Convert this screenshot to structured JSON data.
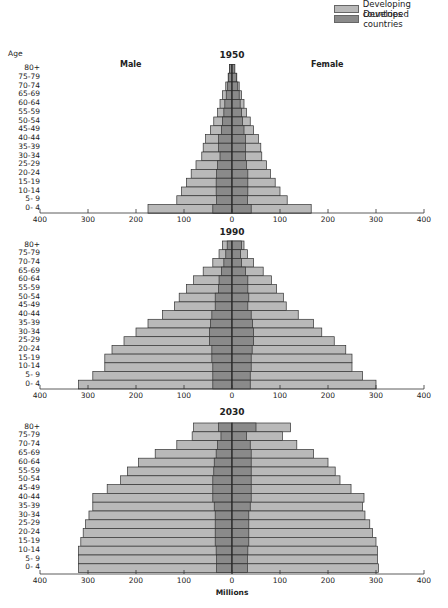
{
  "legend": {
    "items": [
      {
        "label": "Developing countries",
        "color": "#b9b9b9"
      },
      {
        "label": "Developed countries",
        "color": "#8a8a8a"
      }
    ]
  },
  "labels": {
    "age": "Age",
    "male": "Male",
    "female": "Female",
    "xlabel": "Millions"
  },
  "colors": {
    "developing": "#b9b9b9",
    "developed": "#8a8a8a",
    "border": "#333333"
  },
  "chart_data": [
    {
      "type": "bar",
      "subtype": "population-pyramid",
      "title": "1950",
      "xlabel": "",
      "ylabel": "Age",
      "xlim": [
        -400,
        400
      ],
      "x_ticks": [
        400,
        300,
        200,
        100,
        0,
        100,
        200,
        300,
        400
      ],
      "categories": [
        "80+",
        "75-79",
        "70-74",
        "65-69",
        "60-64",
        "55-59",
        "50-54",
        "45-49",
        "40-44",
        "35-39",
        "30-34",
        "25-29",
        "20-24",
        "15-19",
        "10-14",
        "5- 9",
        "0- 4"
      ],
      "series": [
        {
          "name": "Male total (Developing + Developed)",
          "values": [
            5,
            8,
            13,
            20,
            25,
            30,
            38,
            45,
            55,
            60,
            63,
            75,
            85,
            95,
            105,
            115,
            175
          ]
        },
        {
          "name": "Male Developed countries",
          "values": [
            5,
            7,
            9,
            12,
            15,
            17,
            20,
            22,
            28,
            28,
            25,
            30,
            32,
            33,
            33,
            32,
            40
          ]
        },
        {
          "name": "Female total (Developing + Developed)",
          "values": [
            5,
            10,
            15,
            20,
            25,
            30,
            38,
            45,
            55,
            60,
            62,
            72,
            80,
            90,
            100,
            115,
            165
          ]
        },
        {
          "name": "Female Developed countries",
          "values": [
            6,
            9,
            12,
            15,
            17,
            20,
            22,
            25,
            28,
            28,
            28,
            30,
            33,
            33,
            33,
            32,
            40
          ]
        }
      ]
    },
    {
      "type": "bar",
      "subtype": "population-pyramid",
      "title": "1990",
      "xlabel": "",
      "ylabel": "",
      "xlim": [
        -400,
        400
      ],
      "x_ticks": [
        400,
        300,
        200,
        100,
        0,
        100,
        200,
        300,
        400
      ],
      "categories": [
        "80+",
        "75-79",
        "70-74",
        "65-69",
        "60-64",
        "55-59",
        "50-54",
        "45-49",
        "40-44",
        "35-39",
        "30-34",
        "25-29",
        "20-24",
        "15-19",
        "10-14",
        "5- 9",
        "0- 4"
      ],
      "series": [
        {
          "name": "Male total (Developing + Developed)",
          "values": [
            20,
            27,
            40,
            60,
            80,
            95,
            110,
            120,
            145,
            175,
            200,
            225,
            250,
            265,
            265,
            290,
            320
          ]
        },
        {
          "name": "Male Developed countries",
          "values": [
            10,
            13,
            17,
            22,
            27,
            28,
            35,
            35,
            42,
            45,
            47,
            47,
            42,
            42,
            40,
            40,
            40
          ]
        },
        {
          "name": "Female total (Developing + Developed)",
          "values": [
            25,
            32,
            45,
            65,
            82,
            93,
            107,
            113,
            138,
            170,
            187,
            213,
            237,
            250,
            250,
            272,
            300
          ]
        },
        {
          "name": "Female Developed countries",
          "values": [
            20,
            18,
            20,
            28,
            33,
            33,
            35,
            33,
            40,
            43,
            45,
            45,
            42,
            40,
            40,
            38,
            38
          ]
        }
      ]
    },
    {
      "type": "bar",
      "subtype": "population-pyramid",
      "title": "2030",
      "xlabel": "Millions",
      "ylabel": "",
      "xlim": [
        -400,
        400
      ],
      "x_ticks": [
        400,
        300,
        200,
        100,
        0,
        100,
        200,
        300,
        400
      ],
      "categories": [
        "80+",
        "75-79",
        "70-74",
        "65-69",
        "60-64",
        "55-59",
        "50-54",
        "45-49",
        "40-44",
        "35-39",
        "30-34",
        "25-29",
        "20-24",
        "15-19",
        "10-14",
        "5- 9",
        "0- 4"
      ],
      "series": [
        {
          "name": "Male total (Developing + Developed)",
          "values": [
            80,
            83,
            115,
            160,
            195,
            218,
            232,
            260,
            290,
            290,
            298,
            305,
            310,
            315,
            320,
            320,
            320
          ]
        },
        {
          "name": "Male Developed countries",
          "values": [
            28,
            23,
            30,
            33,
            37,
            38,
            40,
            40,
            40,
            37,
            35,
            35,
            35,
            35,
            33,
            32,
            32
          ]
        },
        {
          "name": "Female total (Developing + Developed)",
          "values": [
            122,
            105,
            135,
            170,
            200,
            215,
            225,
            248,
            275,
            272,
            277,
            287,
            293,
            300,
            303,
            303,
            305
          ]
        },
        {
          "name": "Female Developed countries",
          "values": [
            50,
            30,
            38,
            40,
            40,
            40,
            40,
            40,
            40,
            38,
            35,
            35,
            35,
            35,
            33,
            32,
            32
          ]
        }
      ]
    }
  ]
}
